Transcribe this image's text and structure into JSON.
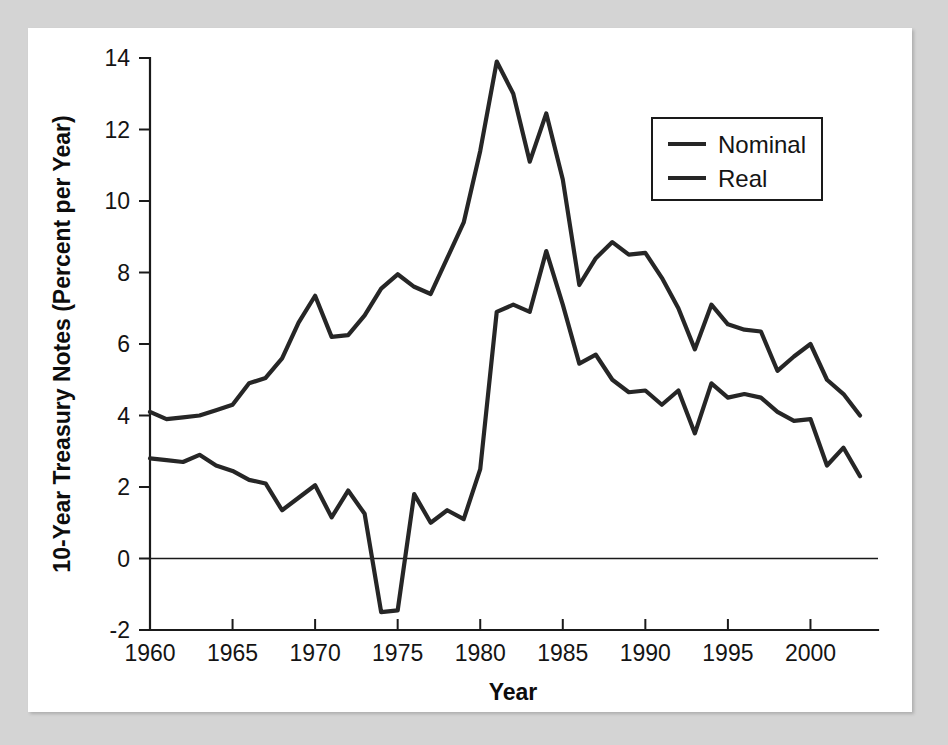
{
  "figure": {
    "background_color": "#d4d4d4",
    "panel_color": "#ffffff",
    "ink_color": "#1a1a1a"
  },
  "chart_data": {
    "type": "line",
    "title": "",
    "subtitle": "",
    "xlabel": "Year",
    "ylabel": "10-Year Treasury Notes (Percent per Year)",
    "xlim": [
      1960,
      2003
    ],
    "ylim": [
      -2,
      14
    ],
    "x_ticks": [
      1960,
      1965,
      1970,
      1975,
      1980,
      1985,
      1990,
      1995,
      2000
    ],
    "x_tick_labels": [
      "1960",
      "1965",
      "1970",
      "1975",
      "1980",
      "1985",
      "1990",
      "1995",
      "2000"
    ],
    "y_ticks": [
      -2,
      0,
      2,
      4,
      6,
      8,
      10,
      12,
      14
    ],
    "y_tick_labels": [
      "-2",
      "0",
      "2",
      "4",
      "6",
      "8",
      "10",
      "12",
      "14"
    ],
    "grid": false,
    "zero_line": true,
    "legend_position": "upper right",
    "legend_entries": [
      "Nominal",
      "Real"
    ],
    "x": [
      1960,
      1961,
      1962,
      1963,
      1964,
      1965,
      1966,
      1967,
      1968,
      1969,
      1970,
      1971,
      1972,
      1973,
      1974,
      1975,
      1976,
      1977,
      1978,
      1979,
      1980,
      1981,
      1982,
      1983,
      1984,
      1985,
      1986,
      1987,
      1988,
      1989,
      1990,
      1991,
      1992,
      1993,
      1994,
      1995,
      1996,
      1997,
      1998,
      1999,
      2000,
      2001,
      2002,
      2003
    ],
    "series": [
      {
        "name": "Nominal",
        "color": "#262626",
        "values": [
          4.1,
          3.9,
          3.95,
          4.0,
          4.15,
          4.3,
          4.9,
          5.05,
          5.6,
          6.6,
          7.35,
          6.2,
          6.25,
          6.8,
          7.55,
          7.95,
          7.6,
          7.4,
          8.4,
          9.4,
          11.4,
          13.9,
          13.0,
          11.1,
          12.45,
          10.6,
          7.65,
          8.4,
          8.85,
          8.5,
          8.55,
          7.85,
          7.0,
          5.85,
          7.1,
          6.55,
          6.4,
          6.35,
          5.25,
          5.65,
          6.0,
          5.0,
          4.6,
          4.0
        ]
      },
      {
        "name": "Real",
        "color": "#262626",
        "values": [
          2.8,
          2.75,
          2.7,
          2.9,
          2.6,
          2.45,
          2.2,
          2.1,
          1.35,
          1.7,
          2.05,
          1.15,
          1.9,
          1.25,
          -1.5,
          -1.45,
          1.8,
          1.0,
          1.35,
          1.1,
          2.5,
          6.9,
          7.1,
          6.9,
          8.6,
          7.1,
          5.45,
          5.7,
          5.0,
          4.65,
          4.7,
          4.3,
          4.7,
          3.5,
          4.9,
          4.5,
          4.6,
          4.5,
          4.1,
          3.85,
          3.9,
          2.6,
          3.1,
          2.3
        ]
      }
    ]
  }
}
